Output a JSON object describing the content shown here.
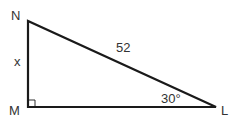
{
  "diagram": {
    "type": "right-triangle",
    "vertices": {
      "N": {
        "label": "N"
      },
      "M": {
        "label": "M"
      },
      "L": {
        "label": "L"
      }
    },
    "sides": {
      "NM": {
        "label": "x"
      },
      "NL": {
        "label": "52"
      }
    },
    "angles": {
      "L": {
        "label": "30°"
      },
      "M": {
        "right_angle": true
      }
    },
    "colors": {
      "stroke": "#1a1a1a",
      "text": "#333333"
    }
  }
}
